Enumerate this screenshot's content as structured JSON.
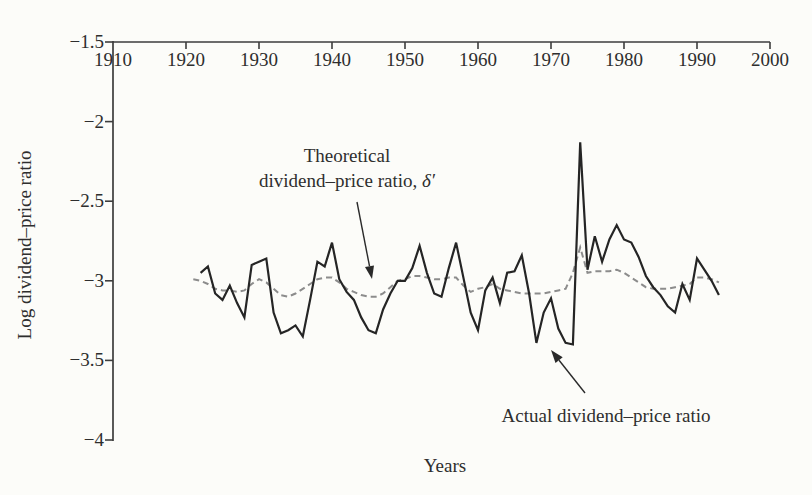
{
  "figure": {
    "background": "#fcfcf9",
    "text_color": "#2e2e2e",
    "axis_color": "#3d3d3d"
  },
  "chart_data": {
    "type": "line",
    "title": "",
    "xlabel": "Years",
    "ylabel": "Log dividend–price ratio",
    "xlim": [
      1910,
      2000
    ],
    "ylim": [
      -4,
      -1.5
    ],
    "grid": false,
    "legend_position": "none (labelled by arrows)",
    "x_ticks": [
      1910,
      1920,
      1930,
      1940,
      1950,
      1960,
      1970,
      1980,
      1990,
      2000
    ],
    "y_ticks": [
      -1.5,
      -2,
      -2.5,
      -3,
      -3.5,
      -4
    ],
    "y_tick_labels": [
      "−1.5",
      "−2",
      "−2.5",
      "−3",
      "−3.5",
      "−4"
    ],
    "x": [
      1921,
      1922,
      1923,
      1924,
      1925,
      1926,
      1927,
      1928,
      1929,
      1930,
      1931,
      1932,
      1933,
      1934,
      1935,
      1936,
      1937,
      1938,
      1939,
      1940,
      1941,
      1942,
      1943,
      1944,
      1945,
      1946,
      1947,
      1948,
      1949,
      1950,
      1951,
      1952,
      1953,
      1954,
      1955,
      1956,
      1957,
      1958,
      1959,
      1960,
      1961,
      1962,
      1963,
      1964,
      1965,
      1966,
      1967,
      1968,
      1969,
      1970,
      1971,
      1972,
      1973,
      1974,
      1975,
      1976,
      1977,
      1978,
      1979,
      1980,
      1981,
      1982,
      1983,
      1984,
      1985,
      1986,
      1987,
      1988,
      1989,
      1990,
      1991,
      1992,
      1993
    ],
    "series": [
      {
        "name": "Theoretical dividend–price ratio, δ′",
        "style": "dashed",
        "color": "#8c8c8c",
        "values": [
          -2.99,
          -3.0,
          -3.02,
          -3.05,
          -3.06,
          -3.06,
          -3.07,
          -3.06,
          -3.02,
          -2.99,
          -3.01,
          -3.05,
          -3.09,
          -3.1,
          -3.08,
          -3.05,
          -3.02,
          -2.99,
          -2.98,
          -2.98,
          -3.01,
          -3.05,
          -3.07,
          -3.09,
          -3.1,
          -3.1,
          -3.08,
          -3.04,
          -3.0,
          -2.99,
          -2.97,
          -2.97,
          -2.98,
          -2.99,
          -2.99,
          -2.98,
          -2.98,
          -3.03,
          -3.07,
          -3.05,
          -3.04,
          -3.02,
          -3.05,
          -3.06,
          -3.07,
          -3.08,
          -3.08,
          -3.08,
          -3.08,
          -3.07,
          -3.06,
          -3.05,
          -2.95,
          -2.79,
          -2.95,
          -2.94,
          -2.94,
          -2.94,
          -2.93,
          -2.95,
          -2.98,
          -3.01,
          -3.04,
          -3.05,
          -3.05,
          -3.05,
          -3.04,
          -3.03,
          -3.02,
          -2.98,
          -2.98,
          -2.99,
          -3.01
        ]
      },
      {
        "name": "Actual dividend–price ratio",
        "style": "solid",
        "color": "#252525",
        "values": [
          null,
          -2.95,
          -2.91,
          -3.08,
          -3.12,
          -3.03,
          -3.14,
          -3.23,
          -2.9,
          -2.88,
          -2.86,
          -3.2,
          -3.33,
          -3.31,
          -3.28,
          -3.35,
          -3.12,
          -2.88,
          -2.91,
          -2.76,
          -2.99,
          -3.07,
          -3.12,
          -3.23,
          -3.31,
          -3.33,
          -3.18,
          -3.08,
          -3.0,
          -3.0,
          -2.92,
          -2.78,
          -2.95,
          -3.08,
          -3.1,
          -2.92,
          -2.76,
          -2.98,
          -3.2,
          -3.31,
          -3.06,
          -2.98,
          -3.14,
          -2.95,
          -2.94,
          -2.84,
          -3.08,
          -3.39,
          -3.2,
          -3.11,
          -3.3,
          -3.39,
          -3.4,
          -2.13,
          -2.93,
          -2.72,
          -2.88,
          -2.74,
          -2.65,
          -2.74,
          -2.76,
          -2.85,
          -2.97,
          -3.04,
          -3.09,
          -3.16,
          -3.2,
          -3.02,
          -3.12,
          -2.86,
          -2.93,
          -3.0,
          -3.09
        ]
      }
    ],
    "annotations": {
      "theoretical": {
        "line1": "Theoretical",
        "line2": "dividend–price ratio, ",
        "symbol": "δ′"
      },
      "actual": {
        "label": "Actual dividend–price ratio"
      }
    }
  }
}
